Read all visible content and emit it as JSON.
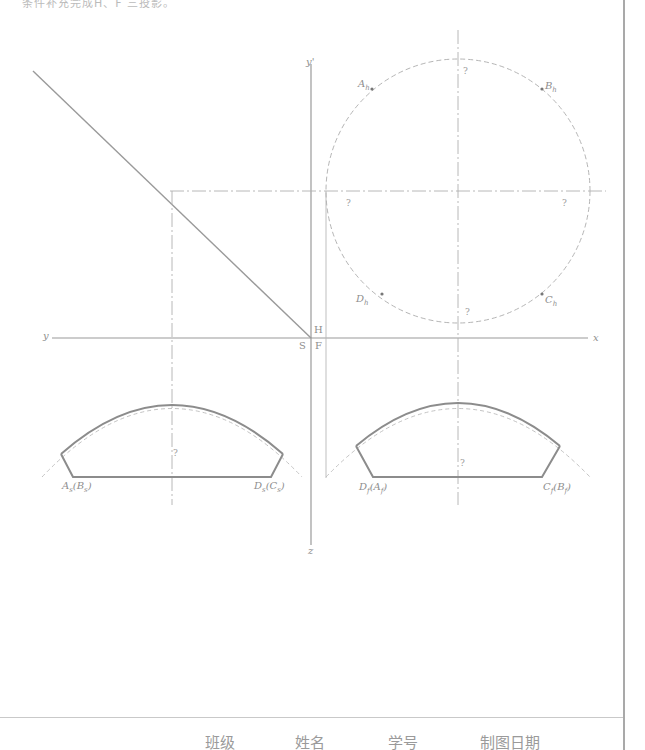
{
  "header": {
    "instruction_fragment": "条件补充完成H、F 三投影。"
  },
  "axes": {
    "y_prime": "y'",
    "y": "y",
    "x": "x",
    "z": "z",
    "plane_H": "H",
    "plane_S": "S",
    "plane_F": "F"
  },
  "points": {
    "A_h": {
      "base": "A",
      "sub": "h"
    },
    "B_h": {
      "base": "B",
      "sub": "h"
    },
    "C_h": {
      "base": "C",
      "sub": "h"
    },
    "D_h": {
      "base": "D",
      "sub": "h"
    },
    "A_s_B_s": {
      "base": "A",
      "sub": "s",
      "paren_base": "B",
      "paren_sub": "s"
    },
    "D_s_C_s": {
      "base": "D",
      "sub": "s",
      "paren_base": "C",
      "paren_sub": "s"
    },
    "D_f_A_f": {
      "base": "D",
      "sub": "f",
      "paren_base": "A",
      "paren_sub": "f"
    },
    "C_f_B_f": {
      "base": "C",
      "sub": "f",
      "paren_base": "B",
      "paren_sub": "f"
    }
  },
  "unknown_marks": {
    "symbol": "?",
    "count": 6
  },
  "footer": {
    "class_label": "班级",
    "name_label": "姓名",
    "student_id_label": "学号",
    "date_label": "制图日期"
  },
  "colors": {
    "line": "#9a9a9a",
    "solid_profile": "#8c8c8c",
    "dashed": "#b5b5b5",
    "border": "#a9a9a9",
    "point": "#777777"
  }
}
